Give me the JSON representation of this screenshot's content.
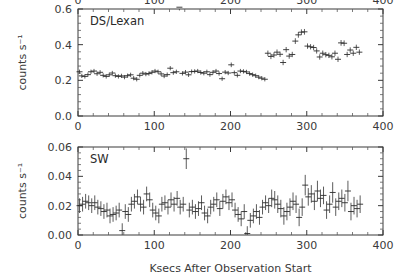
{
  "figure": {
    "xlabel": "Ksecs After Observation Start",
    "background": "#ffffff",
    "foreground": "#3a3a3a"
  },
  "chart_data": [
    {
      "type": "scatter",
      "panel": "top",
      "title": "DS/Lexan",
      "xlabel": "",
      "ylabel": "counts s⁻¹",
      "xlim": [
        0,
        400
      ],
      "ylim": [
        0.0,
        0.6
      ],
      "xticks": [
        0,
        100,
        200,
        300,
        400
      ],
      "xticklabels": [
        "0",
        "100",
        "200",
        "300",
        "400"
      ],
      "yticks": [
        0.0,
        0.2,
        0.4,
        0.6
      ],
      "yticklabels": [
        "0.0",
        "0.2",
        "0.4",
        "0.6"
      ],
      "grid": false,
      "legend": null,
      "marker": "plus",
      "x": [
        2,
        5,
        9,
        13,
        17,
        21,
        25,
        29,
        33,
        37,
        41,
        45,
        49,
        53,
        57,
        61,
        65,
        69,
        73,
        77,
        81,
        85,
        89,
        93,
        97,
        101,
        105,
        109,
        113,
        117,
        121,
        125,
        129,
        133,
        137,
        141,
        145,
        149,
        153,
        157,
        161,
        165,
        169,
        173,
        177,
        181,
        185,
        189,
        193,
        197,
        201,
        205,
        209,
        213,
        217,
        221,
        225,
        229,
        233,
        237,
        241,
        245,
        249,
        253,
        257,
        261,
        265,
        269,
        273,
        277,
        281,
        285,
        289,
        293,
        297,
        301,
        305,
        309,
        313,
        317,
        321,
        325,
        329,
        333,
        337,
        341,
        345,
        349,
        353,
        357,
        361,
        365,
        369
      ],
      "y": [
        0.248,
        0.225,
        0.222,
        0.232,
        0.248,
        0.252,
        0.237,
        0.245,
        0.228,
        0.222,
        0.231,
        0.241,
        0.226,
        0.222,
        0.225,
        0.218,
        0.226,
        0.231,
        0.212,
        0.206,
        0.228,
        0.24,
        0.235,
        0.238,
        0.245,
        0.252,
        0.248,
        0.236,
        0.224,
        0.232,
        0.268,
        0.243,
        0.248,
        0.61,
        0.239,
        0.246,
        0.231,
        0.249,
        0.25,
        0.252,
        0.244,
        0.24,
        0.248,
        0.232,
        0.245,
        0.252,
        0.238,
        0.209,
        0.246,
        0.241,
        0.287,
        0.243,
        0.228,
        0.252,
        0.25,
        0.247,
        0.238,
        0.232,
        0.226,
        0.218,
        0.212,
        0.206,
        0.352,
        0.334,
        0.342,
        0.358,
        0.346,
        0.3,
        0.372,
        0.336,
        0.345,
        0.42,
        0.455,
        0.47,
        0.472,
        0.392,
        0.388,
        0.384,
        0.365,
        0.331,
        0.352,
        0.344,
        0.34,
        0.332,
        0.352,
        0.318,
        0.41,
        0.408,
        0.345,
        0.37,
        0.352,
        0.385,
        0.358
      ],
      "yerr": [
        0.012,
        0.012,
        0.012,
        0.012,
        0.012,
        0.012,
        0.012,
        0.012,
        0.012,
        0.012,
        0.012,
        0.012,
        0.012,
        0.012,
        0.012,
        0.012,
        0.012,
        0.012,
        0.012,
        0.012,
        0.012,
        0.012,
        0.012,
        0.012,
        0.012,
        0.012,
        0.012,
        0.012,
        0.012,
        0.012,
        0.012,
        0.012,
        0.012,
        0.018,
        0.012,
        0.012,
        0.012,
        0.012,
        0.012,
        0.012,
        0.012,
        0.012,
        0.012,
        0.012,
        0.012,
        0.012,
        0.012,
        0.012,
        0.012,
        0.012,
        0.013,
        0.012,
        0.012,
        0.012,
        0.012,
        0.012,
        0.012,
        0.012,
        0.012,
        0.012,
        0.012,
        0.012,
        0.015,
        0.015,
        0.015,
        0.015,
        0.015,
        0.015,
        0.015,
        0.015,
        0.015,
        0.016,
        0.016,
        0.016,
        0.016,
        0.015,
        0.015,
        0.015,
        0.015,
        0.015,
        0.015,
        0.015,
        0.015,
        0.015,
        0.015,
        0.015,
        0.016,
        0.016,
        0.015,
        0.015,
        0.015,
        0.015,
        0.015
      ]
    },
    {
      "type": "scatter",
      "panel": "bottom",
      "title": "SW",
      "xlabel": "Ksecs After Observation Start",
      "ylabel": "counts s⁻¹",
      "xlim": [
        0,
        400
      ],
      "ylim": [
        0.0,
        0.06
      ],
      "xticks": [
        0,
        100,
        200,
        300,
        400
      ],
      "xticklabels": [
        "0",
        "100",
        "200",
        "300",
        "400"
      ],
      "yticks": [
        0.0,
        0.02,
        0.04,
        0.06
      ],
      "yticklabels": [
        "0.00",
        "0.02",
        "0.04",
        "0.06"
      ],
      "grid": false,
      "legend": null,
      "marker": "plus",
      "x": [
        2,
        6,
        10,
        14,
        18,
        22,
        26,
        30,
        34,
        38,
        42,
        46,
        50,
        54,
        58,
        62,
        66,
        70,
        74,
        78,
        82,
        86,
        90,
        94,
        98,
        102,
        106,
        110,
        114,
        118,
        122,
        126,
        130,
        134,
        138,
        142,
        146,
        150,
        154,
        158,
        162,
        166,
        170,
        174,
        178,
        182,
        186,
        190,
        194,
        198,
        202,
        206,
        210,
        214,
        218,
        222,
        226,
        230,
        234,
        238,
        242,
        246,
        250,
        254,
        258,
        262,
        266,
        270,
        274,
        278,
        282,
        286,
        290,
        294,
        298,
        302,
        306,
        310,
        314,
        318,
        322,
        326,
        330,
        334,
        338,
        342,
        346,
        350,
        354,
        358,
        362,
        366,
        370
      ],
      "y": [
        0.02,
        0.021,
        0.023,
        0.022,
        0.02,
        0.022,
        0.019,
        0.018,
        0.016,
        0.017,
        0.013,
        0.014,
        0.015,
        0.017,
        0.003,
        0.016,
        0.014,
        0.021,
        0.023,
        0.026,
        0.021,
        0.019,
        0.028,
        0.024,
        0.017,
        0.015,
        0.013,
        0.021,
        0.022,
        0.019,
        0.024,
        0.021,
        0.025,
        0.019,
        0.021,
        0.052,
        0.017,
        0.019,
        0.016,
        0.018,
        0.022,
        0.015,
        0.013,
        0.019,
        0.021,
        0.024,
        0.018,
        0.023,
        0.026,
        0.022,
        0.024,
        0.017,
        0.014,
        0.011,
        0.016,
        0.001,
        0.01,
        0.013,
        0.016,
        0.012,
        0.019,
        0.022,
        0.02,
        0.025,
        0.024,
        0.021,
        0.018,
        0.013,
        0.016,
        0.019,
        0.023,
        0.021,
        0.012,
        0.019,
        0.034,
        0.026,
        0.028,
        0.023,
        0.03,
        0.025,
        0.027,
        0.017,
        0.021,
        0.029,
        0.019,
        0.023,
        0.025,
        0.022,
        0.03,
        0.016,
        0.02,
        0.018,
        0.021
      ],
      "yerr": [
        0.005,
        0.005,
        0.005,
        0.005,
        0.005,
        0.005,
        0.005,
        0.005,
        0.005,
        0.005,
        0.005,
        0.005,
        0.005,
        0.005,
        0.005,
        0.005,
        0.005,
        0.005,
        0.005,
        0.005,
        0.005,
        0.005,
        0.005,
        0.005,
        0.005,
        0.005,
        0.005,
        0.005,
        0.005,
        0.005,
        0.005,
        0.005,
        0.005,
        0.005,
        0.005,
        0.007,
        0.005,
        0.005,
        0.005,
        0.005,
        0.005,
        0.005,
        0.005,
        0.005,
        0.005,
        0.005,
        0.005,
        0.005,
        0.005,
        0.005,
        0.005,
        0.005,
        0.005,
        0.005,
        0.005,
        0.005,
        0.005,
        0.005,
        0.005,
        0.005,
        0.005,
        0.005,
        0.005,
        0.006,
        0.006,
        0.006,
        0.006,
        0.006,
        0.006,
        0.006,
        0.006,
        0.006,
        0.006,
        0.006,
        0.007,
        0.006,
        0.006,
        0.006,
        0.007,
        0.006,
        0.006,
        0.006,
        0.006,
        0.007,
        0.006,
        0.006,
        0.006,
        0.006,
        0.007,
        0.006,
        0.006,
        0.006,
        0.006
      ]
    }
  ]
}
